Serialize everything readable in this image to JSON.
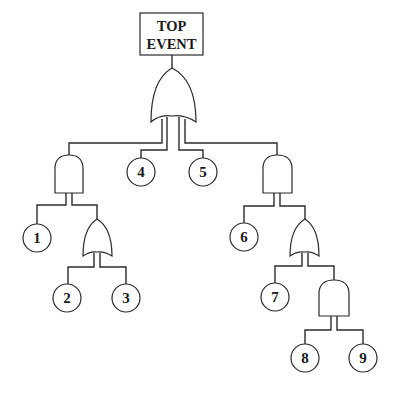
{
  "diagram": {
    "type": "fault-tree",
    "top_event": {
      "line1": "TOP",
      "line2": "EVENT"
    },
    "gates": [
      {
        "id": "G0",
        "type": "OR",
        "parent": "TOP",
        "children": [
          "G1",
          "E4",
          "E5",
          "G2"
        ]
      },
      {
        "id": "G1",
        "type": "AND",
        "parent": "G0",
        "children": [
          "E1",
          "G3"
        ]
      },
      {
        "id": "G3",
        "type": "OR",
        "parent": "G1",
        "children": [
          "E2",
          "E3"
        ]
      },
      {
        "id": "G2",
        "type": "AND",
        "parent": "G0",
        "children": [
          "E6",
          "G4"
        ]
      },
      {
        "id": "G4",
        "type": "OR",
        "parent": "G2",
        "children": [
          "E7",
          "G5"
        ]
      },
      {
        "id": "G5",
        "type": "AND",
        "parent": "G4",
        "children": [
          "E8",
          "E9"
        ]
      }
    ],
    "basic_events": [
      {
        "id": "E1",
        "label": "1"
      },
      {
        "id": "E2",
        "label": "2"
      },
      {
        "id": "E3",
        "label": "3"
      },
      {
        "id": "E4",
        "label": "4"
      },
      {
        "id": "E5",
        "label": "5"
      },
      {
        "id": "E6",
        "label": "6"
      },
      {
        "id": "E7",
        "label": "7"
      },
      {
        "id": "E8",
        "label": "8"
      },
      {
        "id": "E9",
        "label": "9"
      }
    ],
    "colors": {
      "line": "#2b2b2b",
      "background": "#ffffff",
      "text": "#1a1a1a"
    }
  }
}
